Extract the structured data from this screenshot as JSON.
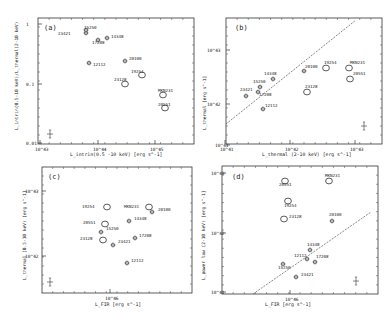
{
  "chart_data": [
    {
      "id": "a",
      "type": "scatter",
      "panel_label": "(a)",
      "xlabel": "L_intrin (0.5 - 10 keV) [erg s^-1]",
      "ylabel": "L_intrin (0.5-10 keV) / L_thermal (2-10 keV)",
      "xscale": "log",
      "yscale": "log",
      "xlim": [
        1e+43,
        2e+45
      ],
      "ylim": [
        0.01,
        1
      ],
      "xticks": [
        "10^43",
        "10^44",
        "10^45"
      ],
      "yticks": [
        "0.01",
        "0.1",
        "1"
      ],
      "points": [
        {
          "name": "23421",
          "x": 6e+43,
          "y": 0.62,
          "marker": "hex"
        },
        {
          "name": "15250",
          "x": 6.2e+43,
          "y": 0.66,
          "marker": "hex"
        },
        {
          "name": "14348",
          "x": 1.4e+44,
          "y": 0.58,
          "marker": "hex"
        },
        {
          "name": "17208",
          "x": 1e+44,
          "y": 0.52,
          "marker": "hex"
        },
        {
          "name": "12112",
          "x": 7e+43,
          "y": 0.22,
          "marker": "hex"
        },
        {
          "name": "20100",
          "x": 3e+44,
          "y": 0.24,
          "marker": "hex"
        },
        {
          "name": "19254",
          "x": 5.5e+44,
          "y": 0.14,
          "marker": "circle"
        },
        {
          "name": "23128",
          "x": 3e+44,
          "y": 0.1,
          "marker": "circle"
        },
        {
          "name": "MKN231",
          "x": 1.3e+45,
          "y": 0.062,
          "marker": "circle"
        },
        {
          "name": "20551",
          "x": 1.4e+45,
          "y": 0.04,
          "marker": "circle"
        }
      ],
      "error_bar_example": {
        "x": 1.7e+43,
        "y": 0.014
      }
    },
    {
      "id": "b",
      "type": "scatter",
      "panel_label": "(b)",
      "xlabel": "L_thermal (2-10 keV) [erg s^-1]",
      "ylabel": "L_thermal [erg s^-1]",
      "xscale": "log",
      "yscale": "log",
      "xlim": [
        1e+41,
        2e+43
      ],
      "ylim": [
        3e+41,
        3e+43
      ],
      "xticks": [
        "10^41",
        "10^42",
        "10^43"
      ],
      "yticks": [
        "10^42",
        "10^43"
      ],
      "line": {
        "desc": "1:1 line",
        "from": [
          1e+41,
          4e+41
        ],
        "to": [
          1.2e+43,
          3e+43
        ]
      },
      "points": [
        {
          "name": "23421",
          "x": 2e+41,
          "y": 1.5e+42,
          "marker": "hex"
        },
        {
          "name": "15250",
          "x": 3.2e+41,
          "y": 2.2e+42,
          "marker": "hex"
        },
        {
          "name": "14348",
          "x": 4.8e+41,
          "y": 3e+42,
          "marker": "hex"
        },
        {
          "name": "17208",
          "x": 3e+41,
          "y": 1.8e+42,
          "marker": "hex"
        },
        {
          "name": "12112",
          "x": 3.4e+41,
          "y": 8e+41,
          "marker": "hex"
        },
        {
          "name": "20100",
          "x": 1.5e+42,
          "y": 4e+42,
          "marker": "hex"
        },
        {
          "name": "19254",
          "x": 3.3e+42,
          "y": 4.8e+42,
          "marker": "circle"
        },
        {
          "name": "23128",
          "x": 1.7e+42,
          "y": 1.7e+42,
          "marker": "circle"
        },
        {
          "name": "MKN231",
          "x": 7.5e+42,
          "y": 4.8e+42,
          "marker": "circle"
        },
        {
          "name": "20551",
          "x": 7.8e+42,
          "y": 3e+42,
          "marker": "circle"
        }
      ],
      "error_bar_example": {
        "x": 1.3e+43,
        "y": 4e+41
      }
    },
    {
      "id": "c",
      "type": "scatter",
      "panel_label": "(c)",
      "xlabel": "L_FIR [erg s^-1]",
      "ylabel": "L_thermal (0.5-10 keV) [erg s^-1]",
      "xscale": "log",
      "yscale": "log",
      "xlim": [
        2e+45,
        1e+46
      ],
      "ylim": [
        4e+41,
        1.3e+43
      ],
      "xticks": [
        "10^46"
      ],
      "yticks": [
        "10^42",
        "10^43"
      ],
      "points": [
        {
          "name": "19254",
          "x": 9e+45,
          "y": 4.8e+42,
          "marker": "circle"
        },
        {
          "name": "MKN231",
          "x": 2.6e+46,
          "y": 4.8e+42,
          "marker": "circle"
        },
        {
          "name": "20100",
          "x": 2.9e+46,
          "y": 4.2e+42,
          "marker": "hex"
        },
        {
          "name": "20551",
          "x": 8.5e+45,
          "y": 3.2e+42,
          "marker": "circle"
        },
        {
          "name": "14348",
          "x": 1.6e+46,
          "y": 3.2e+42,
          "marker": "hex"
        },
        {
          "name": "15250",
          "x": 8e+45,
          "y": 2.3e+42,
          "marker": "hex"
        },
        {
          "name": "23128",
          "x": 8e+45,
          "y": 1.8e+42,
          "marker": "circle"
        },
        {
          "name": "17208",
          "x": 1.9e+46,
          "y": 1.9e+42,
          "marker": "hex"
        },
        {
          "name": "23421",
          "x": 1.05e+46,
          "y": 1.5e+42,
          "marker": "hex"
        },
        {
          "name": "12112",
          "x": 1.5e+46,
          "y": 8.5e+41,
          "marker": "hex"
        }
      ],
      "error_bar_example": {
        "x": 4.5e+45,
        "y": 5.5e+41
      }
    },
    {
      "id": "d",
      "type": "scatter",
      "panel_label": "(d)",
      "xlabel": "L_FIR [erg s^-1]",
      "ylabel": "L_power law (2-10 keV) [erg s^-1]",
      "xscale": "log",
      "yscale": "log",
      "xlim": [
        2e+45,
        1e+46
      ],
      "ylim": [
        1e+41,
        1e+43
      ],
      "xticks": [
        "10^46"
      ],
      "yticks": [
        "10^41",
        "10^42",
        "10^43"
      ],
      "line": {
        "desc": "reference relation",
        "from": [
          5e+45,
          1e+41
        ],
        "to": [
          6e+46,
          1.5e+42
        ]
      },
      "points": [
        {
          "name": "20551",
          "x": 8.5e+45,
          "y": 8e+42,
          "marker": "circle"
        },
        {
          "name": "MKN231",
          "x": 2.6e+46,
          "y": 7.5e+42,
          "marker": "circle"
        },
        {
          "name": "19254",
          "x": 9e+45,
          "y": 3.5e+42,
          "marker": "circle"
        },
        {
          "name": "23128",
          "x": 8.5e+45,
          "y": 1.7e+42,
          "marker": "circle"
        },
        {
          "name": "20100",
          "x": 2.9e+46,
          "y": 1.6e+42,
          "marker": "hex"
        },
        {
          "name": "14348",
          "x": 1.6e+46,
          "y": 5.5e+41,
          "marker": "hex"
        },
        {
          "name": "12112",
          "x": 1.5e+46,
          "y": 3.8e+41,
          "marker": "hex"
        },
        {
          "name": "17208",
          "x": 1.85e+46,
          "y": 3.4e+41,
          "marker": "hex"
        },
        {
          "name": "15250",
          "x": 8e+45,
          "y": 3.2e+41,
          "marker": "hex"
        },
        {
          "name": "23421",
          "x": 1.05e+46,
          "y": 2e+41,
          "marker": "hex"
        }
      ],
      "error_bar_example": {
        "x": 4.5e+46,
        "y": 1.5e+41
      }
    }
  ],
  "panels": {
    "a": {
      "label": "(a)",
      "xlabel": "L_intrin(0.5 -10 keV)  [erg s^-1]",
      "ylabel": "L_intrin(0.5-10 keV)/L_thermal(2-10 keV)",
      "xticks": [
        {
          "t": "10^43",
          "x": 40
        },
        {
          "t": "10^44",
          "x": 98
        },
        {
          "t": "10^45",
          "x": 155
        }
      ],
      "yticks": [
        {
          "t": "1",
          "y": 24
        },
        {
          "t": "0.1",
          "y": 84
        },
        {
          "t": "0.01",
          "y": 143
        }
      ],
      "points": [
        {
          "n": "23421",
          "x": 86,
          "y": 33,
          "m": "hex",
          "lx": 58,
          "ly": 35
        },
        {
          "n": "15250",
          "x": 86,
          "y": 30,
          "m": "hex",
          "lx": 84,
          "ly": 29
        },
        {
          "n": "14348",
          "x": 107,
          "y": 38,
          "m": "hex",
          "lx": 111,
          "ly": 38
        },
        {
          "n": "17208",
          "x": 98,
          "y": 40,
          "m": "hex",
          "lx": 92,
          "ly": 44
        },
        {
          "n": "12112",
          "x": 89,
          "y": 63,
          "m": "hex",
          "lx": 93,
          "ly": 66
        },
        {
          "n": "20100",
          "x": 125,
          "y": 61,
          "m": "hex",
          "lx": 129,
          "ly": 60
        },
        {
          "n": "19254",
          "x": 142,
          "y": 75,
          "m": "circle",
          "lx": 131,
          "ly": 73
        },
        {
          "n": "23128",
          "x": 125,
          "y": 84,
          "m": "circle",
          "lx": 114,
          "ly": 81
        },
        {
          "n": "MKN231",
          "x": 163,
          "y": 95,
          "m": "circle",
          "lx": 158,
          "ly": 92
        },
        {
          "n": "20551",
          "x": 165,
          "y": 108,
          "m": "circle",
          "lx": 158,
          "ly": 106
        }
      ],
      "err": {
        "x": 50,
        "y": 134
      }
    },
    "b": {
      "label": "(b)",
      "xlabel": "L_thermal (2-10 keV) [erg s^-1]",
      "ylabel": "L_thermal [erg s^-1]",
      "xticks": [
        {
          "t": "10^41",
          "x": 225
        },
        {
          "t": "10^42",
          "x": 290
        },
        {
          "t": "10^43",
          "x": 355
        }
      ],
      "yticks": [
        {
          "t": "10^43",
          "x": 217,
          "y": 50
        },
        {
          "t": "10^42",
          "x": 217,
          "y": 104
        },
        {
          "t": "10^41",
          "x": 225,
          "y": 145
        }
      ],
      "points": [
        {
          "n": "23421",
          "x": 246,
          "y": 96,
          "m": "hex",
          "lx": 240,
          "ly": 91
        },
        {
          "n": "15250",
          "x": 260,
          "y": 87,
          "m": "hex",
          "lx": 253,
          "ly": 83
        },
        {
          "n": "14348",
          "x": 273,
          "y": 79,
          "m": "hex",
          "lx": 264,
          "ly": 75
        },
        {
          "n": "17208",
          "x": 258,
          "y": 92,
          "m": "hex",
          "lx": 259,
          "ly": 96
        },
        {
          "n": "12112",
          "x": 263,
          "y": 109,
          "m": "hex",
          "lx": 265,
          "ly": 107
        },
        {
          "n": "20100",
          "x": 304,
          "y": 71,
          "m": "hex",
          "lx": 305,
          "ly": 68
        },
        {
          "n": "19254",
          "x": 326,
          "y": 68,
          "m": "circle",
          "lx": 324,
          "ly": 64
        },
        {
          "n": "23128",
          "x": 307,
          "y": 92,
          "m": "circle",
          "lx": 305,
          "ly": 88
        },
        {
          "n": "MKN231",
          "x": 349,
          "y": 68,
          "m": "circle",
          "lx": 350,
          "ly": 64
        },
        {
          "n": "20551",
          "x": 350,
          "y": 79,
          "m": "circle",
          "lx": 353,
          "ly": 75
        }
      ],
      "line": [
        226,
        124,
        356,
        20
      ],
      "err": {
        "x": 364,
        "y": 126
      }
    },
    "c": {
      "label": "(c)",
      "xlabel": "L_FIR [erg s^-1]",
      "ylabel": "L_thermal (0.5-10 keV) [erg s^-1]",
      "xticks": [
        {
          "t": "10^46",
          "x": 110
        }
      ],
      "yticks": [
        {
          "t": "10^43",
          "x": 35,
          "y": 191
        },
        {
          "t": "10^42",
          "x": 35,
          "y": 256
        }
      ],
      "points": [
        {
          "n": "19254",
          "x": 107,
          "y": 207,
          "m": "circle",
          "lx": 82,
          "ly": 208
        },
        {
          "n": "MKN231",
          "x": 149,
          "y": 207,
          "m": "circle",
          "lx": 124,
          "ly": 208
        },
        {
          "n": "20100",
          "x": 152,
          "y": 212,
          "m": "hex",
          "lx": 158,
          "ly": 211
        },
        {
          "n": "20551",
          "x": 105,
          "y": 224,
          "m": "circle",
          "lx": 83,
          "ly": 224
        },
        {
          "n": "14348",
          "x": 129,
          "y": 221,
          "m": "hex",
          "lx": 134,
          "ly": 220
        },
        {
          "n": "15250",
          "x": 101,
          "y": 232,
          "m": "hex",
          "lx": 106,
          "ly": 230
        },
        {
          "n": "23128",
          "x": 103,
          "y": 240,
          "m": "circle",
          "lx": 80,
          "ly": 240
        },
        {
          "n": "17208",
          "x": 135,
          "y": 238,
          "m": "hex",
          "lx": 139,
          "ly": 237
        },
        {
          "n": "23421",
          "x": 113,
          "y": 245,
          "m": "hex",
          "lx": 118,
          "ly": 243
        },
        {
          "n": "12112",
          "x": 127,
          "y": 263,
          "m": "hex",
          "lx": 131,
          "ly": 262
        }
      ],
      "err": {
        "x": 50,
        "y": 282
      }
    },
    "d": {
      "label": "(d)",
      "xlabel": "L_FIR [erg s^-1]",
      "ylabel": "L_power law (2-10 keV) [erg s^-1]",
      "xticks": [
        {
          "t": "10^46",
          "x": 290
        }
      ],
      "yticks": [
        {
          "t": "10^43",
          "x": 221,
          "y": 173
        },
        {
          "t": "10^42",
          "x": 221,
          "y": 233
        },
        {
          "t": "10^41",
          "x": 221,
          "y": 292
        }
      ],
      "points": [
        {
          "n": "20551",
          "x": 285,
          "y": 181,
          "m": "circle",
          "lx": 279,
          "ly": 186
        },
        {
          "n": "MKN231",
          "x": 329,
          "y": 181,
          "m": "circle",
          "lx": 325,
          "ly": 177
        },
        {
          "n": "19254",
          "x": 288,
          "y": 201,
          "m": "circle",
          "lx": 284,
          "ly": 207
        },
        {
          "n": "23128",
          "x": 284,
          "y": 219,
          "m": "circle",
          "lx": 289,
          "ly": 218
        },
        {
          "n": "20100",
          "x": 332,
          "y": 221,
          "m": "hex",
          "lx": 329,
          "ly": 216
        },
        {
          "n": "14348",
          "x": 310,
          "y": 250,
          "m": "hex",
          "lx": 307,
          "ly": 246
        },
        {
          "n": "12112",
          "x": 307,
          "y": 259,
          "m": "hex",
          "lx": 294,
          "ly": 257
        },
        {
          "n": "17208",
          "x": 315,
          "y": 262,
          "m": "hex",
          "lx": 316,
          "ly": 258
        },
        {
          "n": "15250",
          "x": 283,
          "y": 264,
          "m": "hex",
          "lx": 278,
          "ly": 269
        },
        {
          "n": "23421",
          "x": 296,
          "y": 277,
          "m": "hex",
          "lx": 301,
          "ly": 276
        }
      ],
      "line": [
        253,
        294,
        371,
        212
      ],
      "err": {
        "x": 356,
        "y": 281
      }
    }
  }
}
